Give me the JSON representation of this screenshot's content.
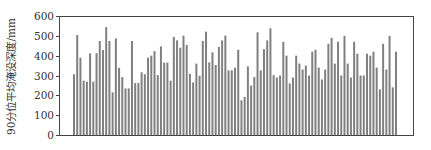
{
  "chart_data": {
    "type": "bar",
    "title": "",
    "xlabel": "",
    "ylabel": "90分位平均淹没深度/mm",
    "ylim": [
      0,
      600
    ],
    "yticks": [
      0,
      100,
      200,
      300,
      400,
      500,
      600
    ],
    "grid": false,
    "legend": null,
    "bar_color": "#808080",
    "x_tick_labels_shown": false,
    "values": [
      306,
      504,
      390,
      274,
      269,
      412,
      269,
      412,
      474,
      428,
      544,
      474,
      215,
      487,
      339,
      292,
      235,
      235,
      474,
      262,
      262,
      316,
      306,
      390,
      400,
      423,
      302,
      447,
      365,
      365,
      274,
      494,
      477,
      440,
      501,
      454,
      309,
      265,
      360,
      299,
      474,
      521,
      366,
      417,
      353,
      444,
      477,
      501,
      326,
      326,
      339,
      430,
      175,
      192,
      346,
      249,
      292,
      518,
      326,
      433,
      477,
      538,
      302,
      290,
      300,
      470,
      400,
      260,
      290,
      400,
      360,
      330,
      350,
      300,
      420,
      430,
      340,
      280,
      330,
      460,
      490,
      360,
      470,
      300,
      500,
      360,
      290,
      470,
      410,
      300,
      300,
      410,
      400,
      420,
      340,
      230,
      460,
      330,
      500,
      240,
      420
    ]
  }
}
